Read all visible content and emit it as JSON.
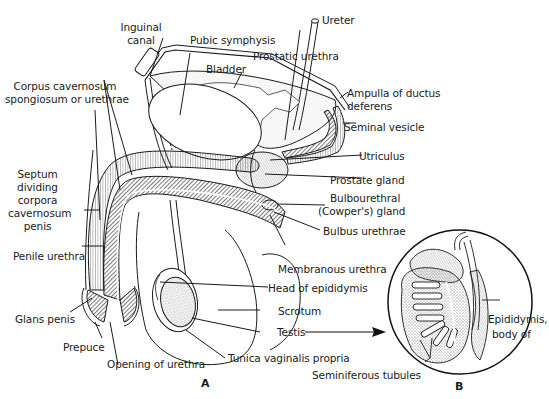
{
  "figure": {
    "panel_a_label": "A",
    "panel_b_label": "B"
  },
  "labels": {
    "ureter": "Ureter",
    "inguinal_canal_1": "Inguinal",
    "inguinal_canal_2": "canal",
    "pubic_symphysis": "Pubic symphysis",
    "prostatic_urethra": "Prostatic urethra",
    "bladder": "Bladder",
    "ampulla_1": "Ampulla of ductus",
    "ampulla_2": "deferens",
    "seminal_vesicle": "Seminal vesicle",
    "corpus_spongiosum_1": "Corpus cavernosum",
    "corpus_spongiosum_2": "spongiosum or urethrae",
    "utriculus": "Utriculus",
    "prostate_gland": "Prostate gland",
    "septum_1": "Septum",
    "septum_2": "dividing",
    "septum_3": "corpora",
    "septum_4": "cavernosum",
    "septum_5": "penis",
    "bulbourethral_1": "Bulbourethral",
    "bulbourethral_2": "(Cowper's) gland",
    "bulbus_urethrae": "Bulbus urethrae",
    "penile_urethra": "Penile urethra",
    "membranous_urethra": "Membranous urethra",
    "head_epididymis": "Head of epididymis",
    "glans_penis": "Glans penis",
    "scrotum": "Scrotum",
    "testis": "Testis",
    "epididymis_body_1": "Epididymis,",
    "epididymis_body_2": "body of",
    "prepuce": "Prepuce",
    "opening_urethra": "Opening of urethra",
    "tunica": "Tunica vaginalis propria",
    "seminiferous": "Seminiferous tubules"
  }
}
